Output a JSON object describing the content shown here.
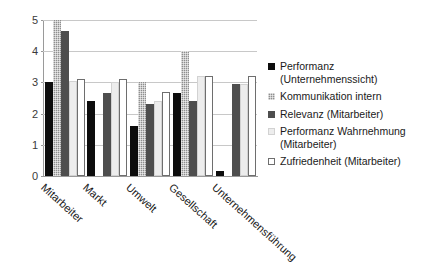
{
  "chart_data": {
    "type": "bar",
    "title": "",
    "subtitle": "",
    "xlabel": "",
    "ylabel": "",
    "ylim": [
      0,
      5
    ],
    "yticks": [
      "0",
      "1",
      "2",
      "3",
      "4",
      "5"
    ],
    "grid": true,
    "legend_position": "right",
    "categories": [
      "Mitarbeiter",
      "Markt",
      "Umwelt",
      "Gesellschaft",
      "Unternehmensführung"
    ],
    "series": [
      {
        "name": "Performanz (Unternehmenssicht)",
        "label_line1": "Performanz",
        "label_line2": "(Unternehmenssicht)",
        "color": "#0d0d0d",
        "style": "solid-black",
        "values": [
          3.0,
          2.4,
          1.6,
          2.65,
          0.15
        ]
      },
      {
        "name": "Kommunikation intern",
        "label_line1": "Kommunikation intern",
        "label_line2": "",
        "color": "#8f8f8f",
        "style": "dotted-gray",
        "values": [
          5.0,
          0,
          3.0,
          4.0,
          0
        ]
      },
      {
        "name": "Relevanz (Mitarbeiter)",
        "label_line1": "Relevanz (Mitarbeiter)",
        "label_line2": "",
        "color": "#4e4e4e",
        "style": "solid-dark-gray",
        "values": [
          4.65,
          2.65,
          2.3,
          2.4,
          2.95
        ]
      },
      {
        "name": "Performanz Wahrnehmung (Mitarbeiter)",
        "label_line1": "Performanz Wahrnehmung",
        "label_line2": "(Mitarbeiter)",
        "color": "#ededed",
        "style": "light-gray",
        "values": [
          3.05,
          3.0,
          2.4,
          3.2,
          2.95
        ]
      },
      {
        "name": "Zufriedenheit (Mitarbeiter)",
        "label_line1": "Zufriedenheit (Mitarbeiter)",
        "label_line2": "",
        "color": "#ffffff",
        "style": "white-outline",
        "values": [
          3.1,
          3.1,
          2.7,
          3.2,
          3.2
        ]
      }
    ]
  }
}
